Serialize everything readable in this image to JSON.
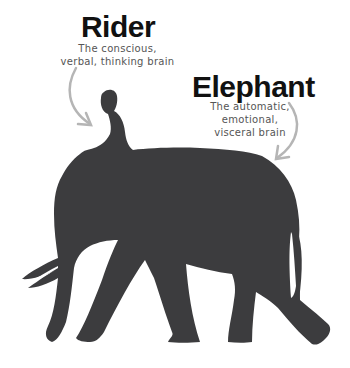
{
  "diagram": {
    "rider": {
      "title": "Rider",
      "description_line1": "The conscious,",
      "description_line2": "verbal, thinking brain"
    },
    "elephant": {
      "title": "Elephant",
      "description_line1": "The automatic,",
      "description_line2": "emotional,",
      "description_line3": "visceral brain"
    }
  },
  "colors": {
    "silhouette": "#3c3c3e",
    "arrow": "#b5b5b5",
    "title": "#111111",
    "subtitle": "#555555",
    "background": "#ffffff"
  }
}
